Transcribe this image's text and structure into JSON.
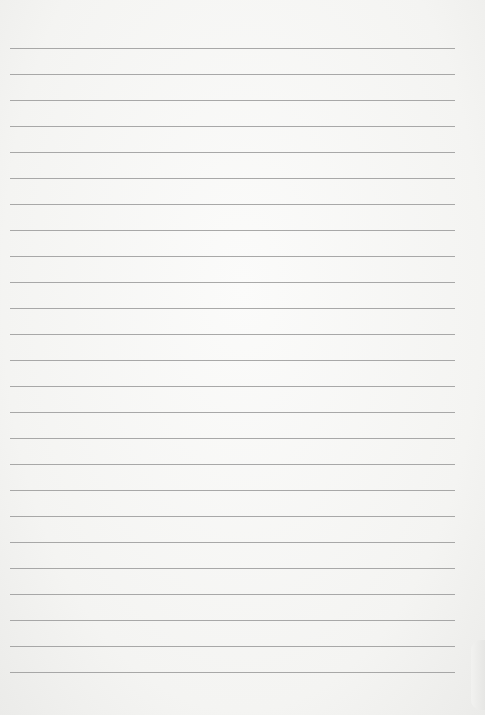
{
  "image": {
    "subject": "lined notebook paper",
    "background_color": "#f6f6f4",
    "line_color": "#9a9a9a",
    "line_count": 25,
    "first_line_y": 48,
    "line_spacing": 26
  }
}
